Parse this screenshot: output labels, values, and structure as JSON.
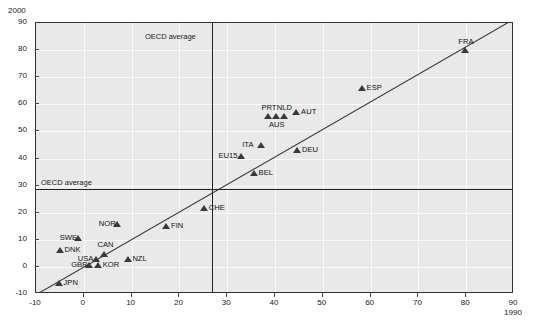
{
  "chart_data": {
    "type": "scatter",
    "title": "",
    "xlabel": "1990",
    "ylabel": "2000",
    "xlim": [
      -10,
      90
    ],
    "ylim": [
      -10,
      90
    ],
    "xticks": [
      -10,
      0,
      10,
      20,
      30,
      40,
      50,
      60,
      70,
      80,
      90
    ],
    "yticks": [
      -10,
      0,
      10,
      20,
      30,
      40,
      50,
      60,
      70,
      80,
      90
    ],
    "grid": true,
    "legend": "none",
    "marker": "triangle-up",
    "marker_color": "#3a3a3a",
    "plot_background": "#e9e9e9",
    "gridline_color": "#fafafa",
    "reference_lines": [
      {
        "orientation": "vertical",
        "label": "OECD average",
        "value": 26.8
      },
      {
        "orientation": "horizontal",
        "label": "OECD average",
        "value": 28.8
      }
    ],
    "trend_line": {
      "x": [
        -9.5,
        90
      ],
      "y": [
        -10.5,
        91
      ]
    },
    "points": [
      {
        "label": "JPN",
        "x": -5.2,
        "y": -6.0,
        "label_pos": "right"
      },
      {
        "label": "DNK",
        "x": -5.0,
        "y": 6.0,
        "label_pos": "right"
      },
      {
        "label": "SWE",
        "x": -1.2,
        "y": 10.5,
        "label_pos": "left"
      },
      {
        "label": "GBR",
        "x": 1.2,
        "y": 0.5,
        "label_pos": "left"
      },
      {
        "label": "KOR",
        "x": 3.0,
        "y": 0.5,
        "label_pos": "right"
      },
      {
        "label": "USA",
        "x": 2.6,
        "y": 2.8,
        "label_pos": "left"
      },
      {
        "label": "CAN",
        "x": 4.3,
        "y": 4.8,
        "label_pos": "above"
      },
      {
        "label": "NZL",
        "x": 9.2,
        "y": 2.8,
        "label_pos": "right"
      },
      {
        "label": "NOR",
        "x": 7.0,
        "y": 15.8,
        "label_pos": "left"
      },
      {
        "label": "FIN",
        "x": 17.3,
        "y": 15.2,
        "label_pos": "right"
      },
      {
        "label": "CHE",
        "x": 25.2,
        "y": 21.5,
        "label_pos": "right"
      },
      {
        "label": "BEL",
        "x": 35.6,
        "y": 34.5,
        "label_pos": "right"
      },
      {
        "label": "EU15",
        "x": 33.0,
        "y": 41.0,
        "label_pos": "left"
      },
      {
        "label": "ITA",
        "x": 37.0,
        "y": 45.0,
        "label_pos": "left"
      },
      {
        "label": "DEU",
        "x": 44.7,
        "y": 43.0,
        "label_pos": "right"
      },
      {
        "label": "PRT",
        "x": 38.6,
        "y": 55.5,
        "label_pos": "above"
      },
      {
        "label": "AUS",
        "x": 40.2,
        "y": 55.5,
        "label_pos": "below"
      },
      {
        "label": "NLD",
        "x": 41.8,
        "y": 55.5,
        "label_pos": "above"
      },
      {
        "label": "AUT",
        "x": 44.5,
        "y": 57.0,
        "label_pos": "right"
      },
      {
        "label": "ESP",
        "x": 58.2,
        "y": 66.0,
        "label_pos": "right"
      },
      {
        "label": "FRA",
        "x": 79.8,
        "y": 80.0,
        "label_pos": "above"
      }
    ]
  }
}
